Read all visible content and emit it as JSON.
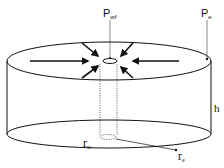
{
  "diagram": {
    "title": "",
    "labels": {
      "p_wf": {
        "main": "P",
        "sub": "wf"
      },
      "p_e": {
        "main": "P",
        "sub": "e"
      },
      "h": "h",
      "r_w": {
        "main": "r",
        "sub": "w"
      },
      "r_e": {
        "main": "r",
        "sub": "e"
      }
    },
    "colors": {
      "stroke": "#111111",
      "background": "#ffffff"
    }
  }
}
